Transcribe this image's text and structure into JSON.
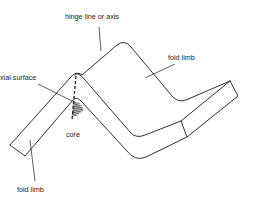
{
  "diagram": {
    "type": "geology-fold",
    "labels": {
      "hinge": "hinge line or axis",
      "fold_limb_top": "fold limb",
      "axial_surface": "xial surface",
      "core": "core",
      "fold_limb_bottom": "fold limb"
    },
    "colors": {
      "line": "#1a1a1a",
      "background": "#ffffff"
    }
  }
}
